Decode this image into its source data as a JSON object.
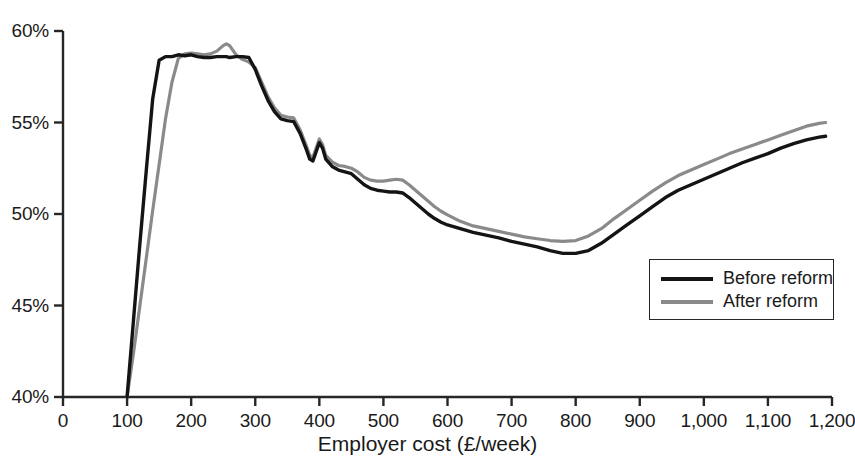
{
  "chart_data": {
    "type": "line",
    "title": "",
    "xlabel": "Employer cost (£/week)",
    "ylabel": "",
    "xlim": [
      0,
      1200
    ],
    "ylim": [
      40,
      60
    ],
    "grid": false,
    "legend_position": "inside-right",
    "x_tick_labels": [
      "0",
      "100",
      "200",
      "300",
      "400",
      "500",
      "600",
      "700",
      "800",
      "900",
      "1,000",
      "1,100",
      "1,200"
    ],
    "x_ticks": [
      0,
      100,
      200,
      300,
      400,
      500,
      600,
      700,
      800,
      900,
      1000,
      1100,
      1200
    ],
    "y_tick_labels": [
      "40%",
      "45%",
      "50%",
      "55%",
      "60%"
    ],
    "y_ticks": [
      40,
      45,
      50,
      55,
      60
    ],
    "x": [
      100,
      110,
      120,
      130,
      140,
      150,
      160,
      170,
      180,
      190,
      200,
      210,
      220,
      230,
      240,
      250,
      255,
      260,
      270,
      280,
      290,
      300,
      310,
      320,
      330,
      340,
      350,
      360,
      370,
      380,
      385,
      390,
      395,
      400,
      405,
      410,
      420,
      430,
      440,
      450,
      460,
      470,
      480,
      490,
      500,
      510,
      520,
      530,
      540,
      550,
      560,
      570,
      580,
      590,
      600,
      620,
      640,
      660,
      680,
      700,
      720,
      740,
      760,
      780,
      800,
      820,
      840,
      860,
      880,
      900,
      920,
      940,
      960,
      980,
      1000,
      1020,
      1040,
      1060,
      1080,
      1100,
      1120,
      1140,
      1160,
      1180,
      1190
    ],
    "series": [
      {
        "name": "Before reform",
        "color": "#141414",
        "values": [
          40.0,
          44.2,
          48.4,
          52.4,
          56.3,
          58.4,
          58.6,
          58.6,
          58.7,
          58.65,
          58.7,
          58.6,
          58.55,
          58.55,
          58.6,
          58.6,
          58.6,
          58.55,
          58.6,
          58.6,
          58.55,
          57.9,
          57.0,
          56.2,
          55.6,
          55.2,
          55.1,
          55.05,
          54.4,
          53.5,
          53.0,
          52.9,
          53.4,
          53.9,
          53.6,
          53.0,
          52.6,
          52.4,
          52.3,
          52.2,
          51.9,
          51.6,
          51.4,
          51.3,
          51.25,
          51.2,
          51.2,
          51.15,
          50.9,
          50.6,
          50.3,
          50.0,
          49.75,
          49.55,
          49.4,
          49.2,
          49.0,
          48.85,
          48.7,
          48.5,
          48.35,
          48.2,
          48.0,
          47.85,
          47.85,
          48.0,
          48.4,
          48.9,
          49.4,
          49.9,
          50.4,
          50.9,
          51.3,
          51.6,
          51.9,
          52.2,
          52.5,
          52.8,
          53.05,
          53.3,
          53.6,
          53.85,
          54.05,
          54.2,
          54.25
        ]
      },
      {
        "name": "After reform",
        "color": "#8a8a8a",
        "values": [
          40.0,
          42.4,
          45.0,
          47.6,
          50.2,
          52.7,
          55.2,
          57.2,
          58.5,
          58.75,
          58.8,
          58.75,
          58.7,
          58.75,
          58.9,
          59.2,
          59.3,
          59.2,
          58.7,
          58.45,
          58.3,
          58.0,
          57.2,
          56.4,
          55.8,
          55.4,
          55.3,
          55.25,
          54.6,
          53.7,
          53.2,
          53.1,
          53.6,
          54.1,
          53.8,
          53.2,
          52.85,
          52.65,
          52.6,
          52.5,
          52.3,
          52.0,
          51.85,
          51.8,
          51.8,
          51.85,
          51.9,
          51.85,
          51.6,
          51.3,
          51.0,
          50.7,
          50.4,
          50.15,
          49.95,
          49.6,
          49.35,
          49.2,
          49.05,
          48.9,
          48.75,
          48.65,
          48.55,
          48.5,
          48.55,
          48.8,
          49.2,
          49.75,
          50.25,
          50.75,
          51.25,
          51.7,
          52.1,
          52.4,
          52.7,
          53.0,
          53.3,
          53.55,
          53.8,
          54.05,
          54.3,
          54.55,
          54.8,
          54.95,
          55.0
        ]
      }
    ]
  },
  "legend": {
    "items": [
      {
        "label": "Before reform",
        "key": "before"
      },
      {
        "label": "After reform",
        "key": "after"
      }
    ]
  },
  "axis": {
    "x_title": "Employer cost (£/week)"
  },
  "colors": {
    "before_reform": "#141414",
    "after_reform": "#8a8a8a",
    "axis": "#262626",
    "background": "#ffffff"
  }
}
